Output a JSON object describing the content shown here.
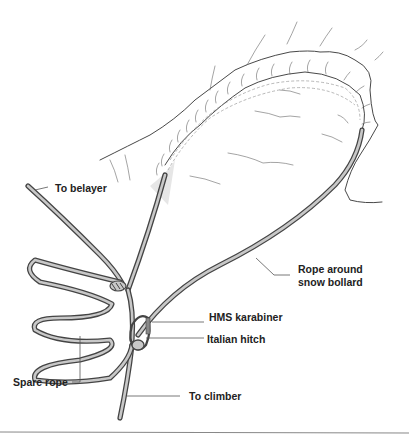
{
  "diagram": {
    "labels": {
      "to_belayer": "To belayer",
      "rope_around_bollard_line1": "Rope around",
      "rope_around_bollard_line2": "snow bollard",
      "hms_karabiner": "HMS karabiner",
      "italian_hitch": "Italian hitch",
      "spare_rope": "Spare rope",
      "to_climber": "To climber"
    },
    "colors": {
      "rope_fill": "#c8c8c8",
      "rope_outline": "#444444",
      "text": "#222222",
      "rule": "#888888"
    }
  }
}
